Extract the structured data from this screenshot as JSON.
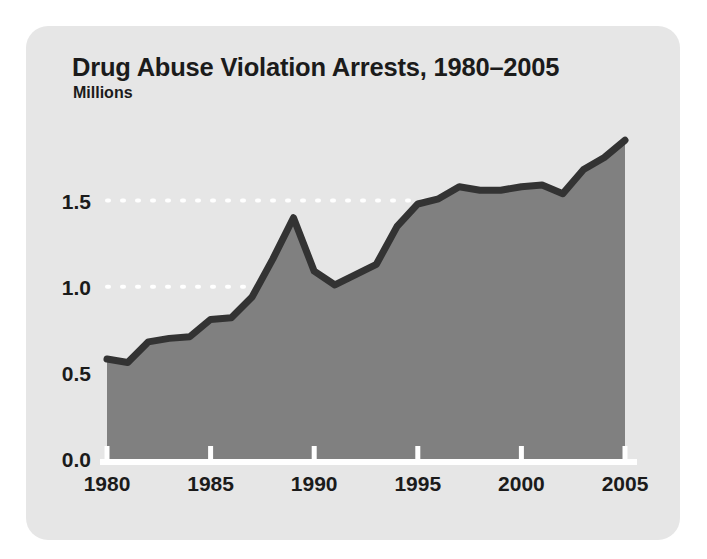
{
  "figure": {
    "title": "Drug Abuse Violation Arrests, 1980–2005",
    "subtitle": "Millions",
    "card_color": "#e6e6e6",
    "page_background": "#ffffff"
  },
  "chart_data": {
    "type": "area",
    "title": "Drug Abuse Violation Arrests, 1980–2005",
    "subtitle": "Millions",
    "xlabel": "",
    "ylabel": "Millions",
    "xlim": [
      1980,
      2005
    ],
    "ylim": [
      0.0,
      1.95
    ],
    "grid": true,
    "grid_values": [
      1.0,
      1.5
    ],
    "grid_style": "white dotted horizontal",
    "legend": null,
    "legend_position": "none",
    "y_ticks": [
      "0.0",
      "0.5",
      "1.0",
      "1.5"
    ],
    "y_tick_values": [
      0.0,
      0.5,
      1.0,
      1.5
    ],
    "x_ticks": [
      "1980",
      "1985",
      "1990",
      "1995",
      "2000",
      "2005"
    ],
    "x_tick_values": [
      1980,
      1985,
      1990,
      1995,
      2000,
      2005
    ],
    "series": [
      {
        "name": "Drug abuse violation arrests",
        "line_color": "#333333",
        "fill_color": "#808080",
        "x": [
          1980,
          1981,
          1982,
          1983,
          1984,
          1985,
          1986,
          1987,
          1988,
          1989,
          1990,
          1991,
          1992,
          1993,
          1994,
          1995,
          1996,
          1997,
          1998,
          1999,
          2000,
          2001,
          2002,
          2003,
          2004,
          2005
        ],
        "values": [
          0.58,
          0.56,
          0.68,
          0.7,
          0.71,
          0.81,
          0.82,
          0.94,
          1.16,
          1.4,
          1.09,
          1.01,
          1.07,
          1.13,
          1.35,
          1.48,
          1.51,
          1.58,
          1.56,
          1.56,
          1.58,
          1.59,
          1.54,
          1.68,
          1.75,
          1.85
        ]
      }
    ]
  }
}
